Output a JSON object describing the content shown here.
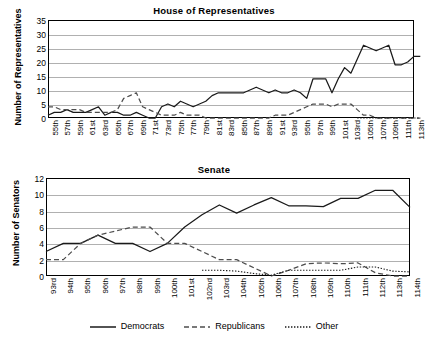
{
  "legend": {
    "items": [
      {
        "label": "Democrats",
        "style": "solid",
        "color": "#1a1a1a"
      },
      {
        "label": "Republicans",
        "style": "dashed",
        "color": "#4d4d4d"
      },
      {
        "label": "Other",
        "style": "dotted",
        "color": "#1a1a1a"
      }
    ]
  },
  "chart_data": [
    {
      "type": "line",
      "title": "House of Representatives",
      "xlabel": "",
      "ylabel": "Number of Representatives",
      "ylim": [
        0,
        35
      ],
      "ytick_step": 5,
      "yticks": [
        0,
        5,
        10,
        15,
        20,
        25,
        30,
        35
      ],
      "grid": true,
      "legend_position": "bottom",
      "categories": [
        "55th",
        "56th",
        "57th",
        "58th",
        "59th",
        "60th",
        "61st",
        "62nd",
        "63rd",
        "64th",
        "65th",
        "66th",
        "67th",
        "68th",
        "69th",
        "70th",
        "71st",
        "72nd",
        "73rd",
        "74th",
        "75th",
        "76th",
        "77th",
        "78th",
        "79th",
        "80th",
        "81st",
        "82nd",
        "83rd",
        "84th",
        "85th",
        "86th",
        "87th",
        "88th",
        "89th",
        "90th",
        "91st",
        "92nd",
        "93rd",
        "94th",
        "95th",
        "96th",
        "97th",
        "98th",
        "99th",
        "100th",
        "101st",
        "102nd",
        "103rd",
        "104th",
        "105th",
        "106th",
        "107th",
        "108th",
        "109th",
        "110th",
        "111th",
        "112th",
        "113th"
      ],
      "xtick_labels": [
        "55th",
        "57th",
        "59th",
        "61st",
        "63rd",
        "65th",
        "67th",
        "69th",
        "71st",
        "73rd",
        "75th",
        "77th",
        "79th",
        "81st",
        "83rd",
        "85th",
        "87th",
        "89th",
        "91st",
        "93rd",
        "95th",
        "97th",
        "99th",
        "101st",
        "103rd",
        "105th",
        "107th",
        "109th",
        "111th",
        "113th"
      ],
      "series": [
        {
          "name": "Democrats",
          "style": "solid",
          "values": [
            1,
            2,
            2,
            3,
            2,
            2,
            2,
            3,
            4,
            1,
            2,
            2,
            1,
            1,
            2,
            1,
            0,
            0,
            4,
            5,
            4,
            6,
            5,
            4,
            5,
            6,
            8,
            9,
            9,
            9,
            9,
            9,
            10,
            11,
            10,
            9,
            10,
            9,
            9,
            10,
            9,
            7,
            14,
            14,
            14,
            9,
            14,
            18,
            16,
            21,
            26,
            25,
            24,
            25,
            26,
            19,
            19,
            20,
            22,
            22
          ]
        },
        {
          "name": "Republicans",
          "style": "dashed",
          "values": [
            4,
            4,
            3,
            3,
            3,
            3,
            2,
            2,
            2,
            2,
            2,
            3,
            7,
            8,
            9,
            4,
            3,
            2,
            1,
            1,
            1,
            2,
            1,
            1,
            1,
            0,
            0,
            0,
            0,
            0,
            0,
            0,
            0,
            0,
            0,
            0,
            1,
            1,
            1,
            2,
            3,
            4,
            5,
            5,
            5,
            4,
            5,
            5,
            5,
            3,
            1,
            1,
            0,
            0,
            0,
            0,
            0,
            0,
            0,
            0
          ]
        },
        {
          "name": "Other",
          "style": "dotted",
          "values": [
            null,
            null,
            null,
            null,
            null,
            null,
            null,
            null,
            null,
            null,
            null,
            null,
            null,
            null,
            null,
            null,
            null,
            null,
            null,
            null,
            null,
            null,
            null,
            null,
            null,
            null,
            null,
            null,
            null,
            null,
            null,
            null,
            null,
            null,
            null,
            null,
            null,
            null,
            null,
            null,
            null,
            null,
            null,
            null,
            null,
            null,
            null,
            null,
            null,
            0,
            0,
            0,
            0,
            0,
            0,
            0,
            0,
            0,
            0,
            0
          ]
        }
      ]
    },
    {
      "type": "line",
      "title": "Senate",
      "xlabel": "",
      "ylabel": "Number of Senators",
      "ylim": [
        0,
        12
      ],
      "ytick_step": 2,
      "yticks": [
        0,
        2,
        4,
        6,
        8,
        10,
        12
      ],
      "grid": true,
      "legend_position": "bottom",
      "categories": [
        "93rd",
        "94th",
        "95th",
        "96th",
        "97th",
        "98th",
        "99th",
        "100th",
        "101st",
        "102nd",
        "103rd",
        "104th",
        "105th",
        "106th",
        "107th",
        "108th",
        "109th",
        "110th",
        "111th",
        "112th",
        "113th",
        "114th"
      ],
      "xtick_labels": [
        "93rd",
        "94th",
        "95th",
        "96th",
        "97th",
        "98th",
        "99th",
        "100th",
        "101st",
        "102nd",
        "103rd",
        "104th",
        "105th",
        "106th",
        "107th",
        "108th",
        "109th",
        "110th",
        "111th",
        "112th",
        "113th",
        "114th"
      ],
      "series": [
        {
          "name": "Democrats",
          "style": "solid",
          "values": [
            3,
            4,
            4,
            5,
            4,
            4,
            3,
            4,
            6,
            7.5,
            8.7,
            7.7,
            8.7,
            9.6,
            8.6,
            8.6,
            8.5,
            9.5,
            9.5,
            10.5,
            10.5,
            8.4
          ]
        },
        {
          "name": "Republicans",
          "style": "dashed",
          "values": [
            2,
            2,
            4,
            5,
            5.5,
            6,
            6,
            4,
            4,
            3,
            2,
            2,
            1,
            0,
            0.7,
            1.5,
            1.6,
            1.5,
            1.6,
            0.4,
            0,
            0
          ]
        },
        {
          "name": "Other",
          "style": "dotted",
          "values": [
            null,
            null,
            null,
            null,
            null,
            null,
            null,
            null,
            null,
            0.7,
            0.7,
            0.6,
            0.3,
            0.1,
            0.7,
            0.7,
            0.7,
            0.7,
            1.1,
            1.1,
            0.6,
            0.5
          ]
        }
      ]
    }
  ]
}
